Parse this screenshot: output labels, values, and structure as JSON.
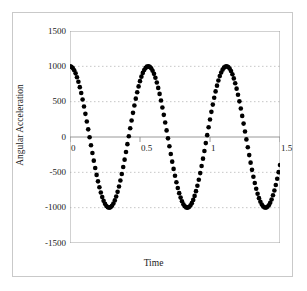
{
  "chart_data": {
    "type": "line",
    "title": "",
    "xlabel": "Time",
    "ylabel": "Angular Acceleration",
    "xlim": [
      0,
      1.5
    ],
    "ylim": [
      -1500,
      1500
    ],
    "xticks": [
      0,
      0.5,
      1,
      1.5
    ],
    "xtick_labels": [
      "0",
      "0.5",
      "1",
      "1.5"
    ],
    "yticks": [
      -1500,
      -1000,
      -500,
      0,
      500,
      1000,
      1500
    ],
    "ytick_labels": [
      "-1500",
      "-1000",
      "-500",
      "0",
      "500",
      "1000",
      "1500"
    ],
    "grid": "horizontal-dotted",
    "legend": "none",
    "series": [
      {
        "name": "Angular Acceleration",
        "marker": "filled-circle",
        "color": "#000000",
        "amplitude": 1000,
        "frequency_hz": 1.79,
        "phase": "cosine",
        "equation": "1000*cos(2*pi*1.79*t)",
        "x": [
          0.0,
          0.05,
          0.1,
          0.15,
          0.2,
          0.25,
          0.3,
          0.35,
          0.4,
          0.45,
          0.5,
          0.55,
          0.6,
          0.65,
          0.7,
          0.75,
          0.8,
          0.85,
          0.9,
          0.95,
          1.0,
          1.05,
          1.1,
          1.15,
          1.2,
          1.25,
          1.3,
          1.35,
          1.4,
          1.45,
          1.5
        ],
        "values": [
          1000,
          849,
          442,
          -90,
          -594,
          -913,
          -969,
          -758,
          -344,
          189,
          673,
          950,
          945,
          660,
          194,
          -288,
          -721,
          -966,
          -957,
          -699,
          -242,
          246,
          701,
          958,
          965,
          715,
          265,
          -223,
          -684,
          -953,
          -650
        ]
      }
    ],
    "annotations": {
      "peaks": [
        {
          "t": 0.0,
          "y": 1000
        },
        {
          "t": 0.56,
          "y": 1000
        },
        {
          "t": 1.12,
          "y": 1000
        }
      ],
      "troughs": [
        {
          "t": 0.28,
          "y": -1000
        },
        {
          "t": 0.84,
          "y": -1000
        }
      ],
      "end_point": {
        "t": 1.5,
        "y": -650
      }
    },
    "colors": {
      "line": "#000000",
      "grid": "#b8b8b8",
      "axis": "#808080",
      "frame": "#c9c9c9",
      "background": "#ffffff",
      "text": "#1a1a1a"
    }
  }
}
